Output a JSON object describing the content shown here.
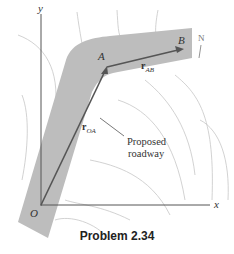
{
  "figure": {
    "axes": {
      "x_label": "x",
      "y_label": "y",
      "origin_label": "O"
    },
    "points": {
      "A": "A",
      "B": "B"
    },
    "vectors": {
      "OA": {
        "bold": "r",
        "sub": "OA"
      },
      "AB": {
        "bold": "r",
        "sub": "AB"
      }
    },
    "annotation": {
      "line1": "Proposed",
      "line2": "roadway"
    },
    "north_label": "N",
    "caption": "Problem 2.34",
    "colors": {
      "road": "#b9b9b9",
      "vector": "#555555",
      "contour": "#c4c4c4",
      "axis": "#555555"
    }
  }
}
